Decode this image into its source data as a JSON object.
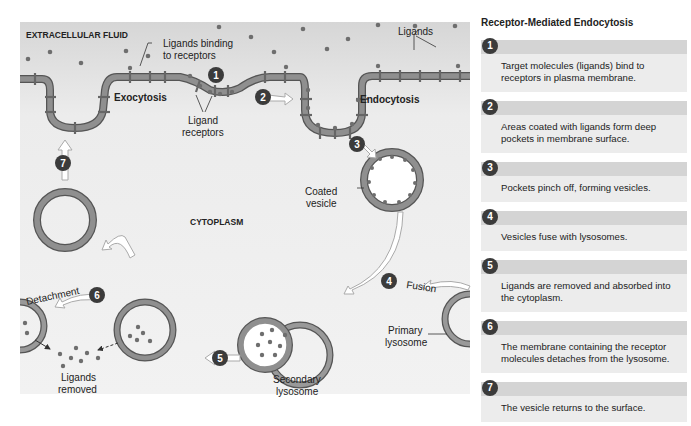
{
  "diagram": {
    "region_labels": {
      "extracellular": "EXTRACELLULAR FLUID",
      "cytoplasm": "CYTOPLASM"
    },
    "labels": {
      "ligands_binding_1": "Ligands binding",
      "ligands_binding_2": "to receptors",
      "ligands": "Ligands",
      "exocytosis": "Exocytosis",
      "endocytosis": "Endocytosis",
      "ligand_receptors_1": "Ligand",
      "ligand_receptors_2": "receptors",
      "coated_vesicle_1": "Coated",
      "coated_vesicle_2": "vesicle",
      "fusion": "Fusion",
      "detachment": "Detachment",
      "primary_lysosome_1": "Primary",
      "primary_lysosome_2": "lysosome",
      "secondary_lysosome_1": "Secondary",
      "secondary_lysosome_2": "lysosome",
      "ligands_removed_1": "Ligands",
      "ligands_removed_2": "removed"
    },
    "step_markers": [
      "1",
      "2",
      "3",
      "4",
      "5",
      "6",
      "7"
    ],
    "colors": {
      "membrane": "#8a8a8a",
      "membrane_outline": "#555555",
      "ligand": "#6e6e6e",
      "background_top": "#d9d9d9",
      "background": "#f0f0f0",
      "marker": "#3b3b3b"
    }
  },
  "panel": {
    "title": "Receptor-Mediated Endocytosis",
    "steps": [
      {
        "num": "1",
        "text": "Target molecules (ligands) bind to receptors in plasma membrane."
      },
      {
        "num": "2",
        "text": "Areas coated with ligands form deep pockets in membrane surface."
      },
      {
        "num": "3",
        "text": "Pockets pinch off, forming vesicles."
      },
      {
        "num": "4",
        "text": "Vesicles fuse with lysosomes."
      },
      {
        "num": "5",
        "text": "Ligands are removed and absorbed into the cytoplasm."
      },
      {
        "num": "6",
        "text": "The membrane containing the receptor molecules detaches from the lysosome."
      },
      {
        "num": "7",
        "text": "The vesicle returns to the surface."
      }
    ]
  }
}
